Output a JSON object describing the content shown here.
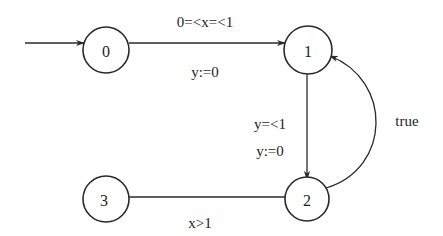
{
  "diagram": {
    "type": "timed-automaton",
    "colors": {
      "stroke": "#2a2a2a",
      "text": "#1e1e1e",
      "background": "#ffffff"
    },
    "states": [
      {
        "id": "0",
        "label": "0",
        "cx": 106,
        "cy": 50,
        "r": 23,
        "initial": true
      },
      {
        "id": "1",
        "label": "1",
        "cx": 308,
        "cy": 50,
        "r": 24
      },
      {
        "id": "2",
        "label": "2",
        "cx": 307,
        "cy": 199,
        "r": 22
      },
      {
        "id": "3",
        "label": "3",
        "cx": 106,
        "cy": 199,
        "r": 23
      }
    ],
    "transitions": [
      {
        "from": "init",
        "to": "0",
        "guard": "",
        "reset": ""
      },
      {
        "from": "0",
        "to": "1",
        "guard": "0=<x=<1",
        "reset": "y:=0"
      },
      {
        "from": "1",
        "to": "2",
        "guard": "y=<1",
        "reset": "y:=0"
      },
      {
        "from": "2",
        "to": "1",
        "guard": "true",
        "reset": ""
      },
      {
        "from": "2",
        "to": "3",
        "guard": "x>1",
        "reset": ""
      }
    ]
  }
}
